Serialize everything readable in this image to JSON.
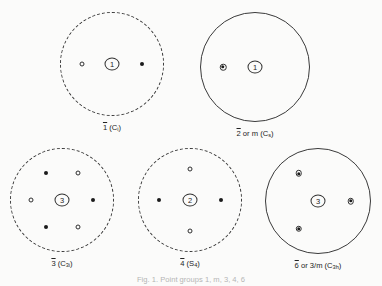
{
  "figure": {
    "caption": "Fig. 1. Point groups 1, m, 3, 4, 6",
    "background_color": "#fbfbfa",
    "ink_color": "#2a2a2a"
  },
  "legend": {
    "filled_symbol_name": "filled-circle-upper-hemisphere",
    "open_symbol_name": "open-circle-lower-hemisphere",
    "superposed_symbol_name": "superposed-circle-dot"
  },
  "diagrams": [
    {
      "id": "one-bar",
      "label_parts": {
        "bar_text": "1",
        "rest": " (C",
        "sub": "i",
        "tail": ")"
      },
      "label_plain": "1̅ (Ci)",
      "circle_style": "dashed",
      "center_symbol": "1",
      "center_symbol_name": "inversion-center-symbol",
      "points": [
        {
          "type": "open",
          "x": -0.58,
          "y": 0.0
        },
        {
          "type": "filled",
          "x": 0.58,
          "y": 0.0
        }
      ]
    },
    {
      "id": "two-bar-m",
      "label_parts": {
        "bar_text": "2",
        "rest": " or m (C",
        "sub": "s",
        "tail": ")"
      },
      "label_plain": "2̅ or m (Cs)",
      "circle_style": "solid",
      "center_symbol": "1",
      "center_symbol_name": "onefold-axis-symbol",
      "points": [
        {
          "type": "super",
          "x": -0.58,
          "y": 0.0
        }
      ]
    },
    {
      "id": "three-bar",
      "label_parts": {
        "bar_text": "3",
        "rest": " (C",
        "sub": "3i",
        "tail": ")"
      },
      "label_plain": "3̅ (C3i)",
      "circle_style": "dashed",
      "center_symbol": "3",
      "center_symbol_name": "threefold-inversion-axis-symbol",
      "points": [
        {
          "type": "filled",
          "x": -0.3,
          "y": -0.52
        },
        {
          "type": "open",
          "x": 0.3,
          "y": -0.52
        },
        {
          "type": "open",
          "x": -0.6,
          "y": 0.0
        },
        {
          "type": "filled",
          "x": 0.6,
          "y": 0.0
        },
        {
          "type": "filled",
          "x": -0.3,
          "y": 0.52
        },
        {
          "type": "open",
          "x": 0.3,
          "y": 0.52
        }
      ]
    },
    {
      "id": "four-bar",
      "label_parts": {
        "bar_text": "4",
        "rest": " (S",
        "sub": "4",
        "tail": ")"
      },
      "label_plain": "4̅ (S4)",
      "circle_style": "dashed",
      "center_symbol": "2",
      "center_symbol_name": "fourfold-inversion-axis-symbol",
      "points": [
        {
          "type": "open",
          "x": 0.0,
          "y": -0.6
        },
        {
          "type": "filled",
          "x": -0.6,
          "y": 0.0
        },
        {
          "type": "filled",
          "x": 0.6,
          "y": 0.0
        },
        {
          "type": "open",
          "x": 0.0,
          "y": 0.6
        }
      ]
    },
    {
      "id": "six-bar",
      "label_parts": {
        "bar_text": "6",
        "rest": " or 3/m (C",
        "sub": "3h",
        "tail": ")"
      },
      "label_plain": "6̅ or 3/m (C3h)",
      "circle_style": "solid",
      "center_symbol": "3",
      "center_symbol_name": "sixfold-inversion-axis-symbol",
      "points": [
        {
          "type": "super",
          "x": -0.36,
          "y": -0.52
        },
        {
          "type": "super",
          "x": 0.62,
          "y": 0.0
        },
        {
          "type": "super",
          "x": -0.36,
          "y": 0.52
        }
      ]
    }
  ]
}
